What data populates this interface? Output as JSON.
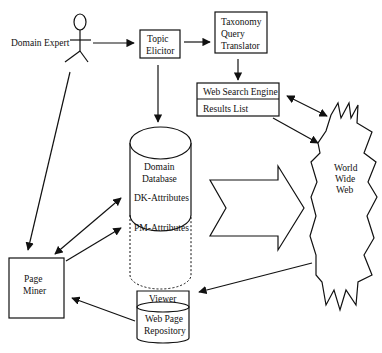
{
  "diagram": {
    "type": "system-architecture",
    "nodes": {
      "domain_expert": {
        "label": "Domain Expert",
        "shape": "actor"
      },
      "topic_elicitor": {
        "line1": "Topic",
        "line2": "Elicitor",
        "shape": "box"
      },
      "taxonomy_query_translator": {
        "line1": "Taxonomy",
        "line2": "Query",
        "line3": "Translator",
        "shape": "box"
      },
      "web_search_engine": {
        "label": "Web Search Engine",
        "shape": "box"
      },
      "results_list": {
        "label": "Results List",
        "shape": "box"
      },
      "domain_database": {
        "line1": "Domain",
        "line2": "Database",
        "shape": "cylinder"
      },
      "dk_attributes": {
        "label": "DK-Attributes"
      },
      "pm_attributes": {
        "label": "PM-Attributes"
      },
      "world_wide_web": {
        "line1": "World",
        "line2": "Wide",
        "line3": "Web",
        "shape": "starburst"
      },
      "page_miner": {
        "line1": "Page",
        "line2": "Miner",
        "shape": "box"
      },
      "viewer": {
        "label": "Viewer"
      },
      "web_page_repository": {
        "line1": "Web Page",
        "line2": "Repository",
        "shape": "cylinder"
      }
    },
    "edges": [
      {
        "from": "Domain Expert",
        "to": "Topic Elicitor",
        "type": "arrow"
      },
      {
        "from": "Topic Elicitor",
        "to": "Taxonomy Query Translator",
        "type": "arrow"
      },
      {
        "from": "Taxonomy Query Translator",
        "to": "Web Search Engine",
        "type": "arrow"
      },
      {
        "from": "Topic Elicitor",
        "to": "Domain Database",
        "type": "arrow"
      },
      {
        "from": "Web Search Engine",
        "to": "World Wide Web",
        "type": "bidirectional"
      },
      {
        "from": "Results List",
        "to": "World Wide Web",
        "type": "arrow"
      },
      {
        "from": "Domain Database",
        "to": "World Wide Web",
        "type": "block-arrow"
      },
      {
        "from": "Domain Expert",
        "to": "Page Miner",
        "type": "arrow"
      },
      {
        "from": "Page Miner",
        "to": "DK-Attributes",
        "type": "bidirectional"
      },
      {
        "from": "Page Miner",
        "to": "PM-Attributes",
        "type": "arrow"
      },
      {
        "from": "World Wide Web",
        "to": "Viewer",
        "type": "arrow"
      },
      {
        "from": "Web Page Repository",
        "to": "Page Miner",
        "type": "arrow"
      }
    ]
  }
}
